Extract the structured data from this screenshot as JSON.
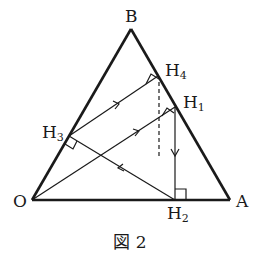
{
  "figure": {
    "caption": "図 2",
    "points": {
      "B": {
        "label": "B",
        "x": 131,
        "y": 29
      },
      "O": {
        "label": "O",
        "x": 32,
        "y": 200
      },
      "A": {
        "label": "A",
        "x": 230,
        "y": 200
      },
      "H1": {
        "label": "H",
        "sub": "1",
        "x": 175,
        "y": 107
      },
      "H2": {
        "label": "H",
        "sub": "2",
        "x": 175,
        "y": 200
      },
      "H3": {
        "label": "H",
        "sub": "3",
        "x": 69,
        "y": 136
      },
      "H4": {
        "label": "H",
        "sub": "4",
        "x": 158,
        "y": 76
      }
    },
    "segments": [
      {
        "name": "side-OB",
        "from": "O",
        "to": "B",
        "style": "bold"
      },
      {
        "name": "side-BA",
        "from": "B",
        "to": "A",
        "style": "bold"
      },
      {
        "name": "side-OA",
        "from": "O",
        "to": "A",
        "style": "bold"
      },
      {
        "name": "O-H1",
        "from": "O",
        "to": "H1",
        "style": "thin",
        "arrow": "toward H1"
      },
      {
        "name": "H1-H2",
        "from": "H1",
        "to": "H2",
        "style": "thin",
        "arrow": "toward H2"
      },
      {
        "name": "H2-H3",
        "from": "H2",
        "to": "H3",
        "style": "thin",
        "arrow": "toward H3"
      },
      {
        "name": "H3-H4",
        "from": "H3",
        "to": "H4",
        "style": "thin",
        "arrow": "toward H4"
      },
      {
        "name": "dashed-from-H4",
        "from": "H4",
        "to": "down",
        "style": "dashed"
      }
    ],
    "right_angles": [
      "H1",
      "H2",
      "H3",
      "H4"
    ]
  }
}
